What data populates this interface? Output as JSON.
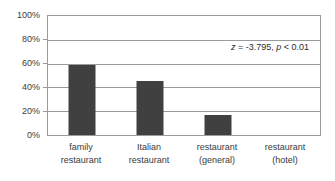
{
  "chart_data": {
    "type": "bar",
    "title": "",
    "subtitle": "",
    "xlabel": "",
    "ylabel": "",
    "categories": [
      "family restaurant",
      "Italian restaurant",
      "restaurant (general)",
      "restaurant (hotel)"
    ],
    "category_lines": [
      [
        "family",
        "restaurant"
      ],
      [
        "Italian",
        "restaurant"
      ],
      [
        "restaurant",
        "(general)"
      ],
      [
        "restaurant",
        "(hotel)"
      ]
    ],
    "values": [
      59,
      45,
      17,
      0
    ],
    "value_labels": [
      "59%",
      "45%",
      "17%",
      "0%"
    ],
    "ylim": [
      0,
      100
    ],
    "ytick_values": [
      0,
      20,
      40,
      60,
      80,
      100
    ],
    "ytick_labels": [
      "0%",
      "20%",
      "40%",
      "60%",
      "80%",
      "100%"
    ],
    "grid": true,
    "grid_axis": "y",
    "legend": false,
    "legend_position": "none",
    "annotations": [
      {
        "name": "statistics-annotation",
        "text": "z = -3.795, p < 0.01",
        "parts": {
          "stat_symbol": "z",
          "equals": " = ",
          "stat_value": "-3.795",
          "separator": ", ",
          "p_symbol": "p",
          "p_value": " < 0.01"
        },
        "position": "top-right"
      }
    ],
    "colors": {
      "bar": "#404040",
      "grid": "#9a9a9a",
      "axis": "#9a9a9a",
      "text": "#3a3a3a",
      "background": "#ffffff"
    }
  }
}
